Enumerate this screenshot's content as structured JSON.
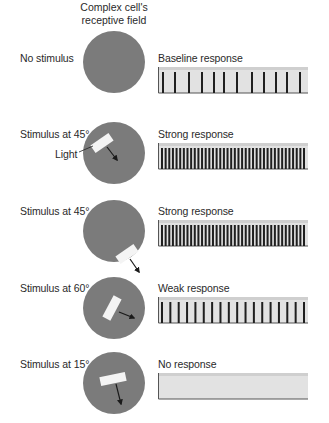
{
  "header": {
    "line1": "Complex cell's",
    "line2": "receptive field"
  },
  "colors": {
    "field": "#7b7b7b",
    "bar": "#f4f4f4",
    "panel": "#e2e2e2",
    "panel_top": "#cfcfcf",
    "spike": "#1f1f1f",
    "axis": "#555555",
    "text": "#2a2a2a"
  },
  "callout": {
    "label": "Light"
  },
  "rows": [
    {
      "stimulus_label": "No stimulus",
      "response_label": "Baseline response",
      "spike_count": 12,
      "spikes_x": [
        163,
        175,
        189,
        202,
        214,
        224,
        237,
        252,
        264,
        276,
        287,
        300
      ],
      "has_bar": false
    },
    {
      "stimulus_label": "Stimulus at 45°",
      "response_label": "Strong response",
      "spike_count": 40,
      "has_bar": true
    },
    {
      "stimulus_label": "Stimulus at 45°",
      "response_label": "Strong response",
      "spike_count": 40,
      "has_bar": true
    },
    {
      "stimulus_label": "Stimulus at 60°",
      "response_label": "Weak response",
      "spike_count": 18,
      "has_bar": true
    },
    {
      "stimulus_label": "Stimulus at 15°",
      "response_label": "No response",
      "spike_count": 0,
      "has_bar": true
    }
  ]
}
